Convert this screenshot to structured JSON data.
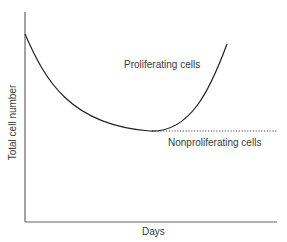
{
  "diagram": {
    "axes": {
      "x_label": "Days",
      "y_label": "Total cell number"
    },
    "curves": [
      {
        "name": "proliferating",
        "label": "Proliferating cells",
        "style": "solid"
      },
      {
        "name": "nonproliferating",
        "label": "Nonproliferating cells",
        "style": "dotted"
      }
    ],
    "colors": {
      "axis": "#555555",
      "curve": "#222222",
      "text": "#3a3a3a"
    }
  }
}
